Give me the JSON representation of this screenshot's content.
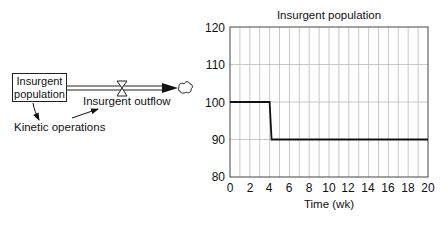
{
  "diagram": {
    "stock": {
      "label_line1": "Insurgent",
      "label_line2": "population"
    },
    "flow": {
      "label": "Insurgent outflow"
    },
    "auxiliary": {
      "label": "Kinetic operations"
    },
    "icons": [
      "stock-box",
      "flow-pipe",
      "valve-icon",
      "arrowhead-icon",
      "cloud-sink-icon",
      "causal-link-arrow"
    ]
  },
  "chart_data": {
    "type": "line",
    "title": "Insurgent population",
    "xlabel": "Time (wk)",
    "ylabel": "",
    "xlim": [
      0,
      20
    ],
    "ylim": [
      80,
      120
    ],
    "x_ticks": [
      "0",
      "2",
      "4",
      "6",
      "8",
      "10",
      "12",
      "14",
      "16",
      "18",
      "20"
    ],
    "y_ticks": [
      "80",
      "90",
      "100",
      "110",
      "120"
    ],
    "grid": {
      "vertical_every": 1,
      "horizontal_every": 10
    },
    "legend": "none",
    "series": [
      {
        "name": "Insurgent population",
        "x": [
          0,
          4,
          4.2,
          20
        ],
        "values": [
          100,
          100,
          90,
          90
        ]
      }
    ],
    "colors": {
      "line": "#111111",
      "grid": "#bbbbbb",
      "axis": "#444444"
    }
  }
}
